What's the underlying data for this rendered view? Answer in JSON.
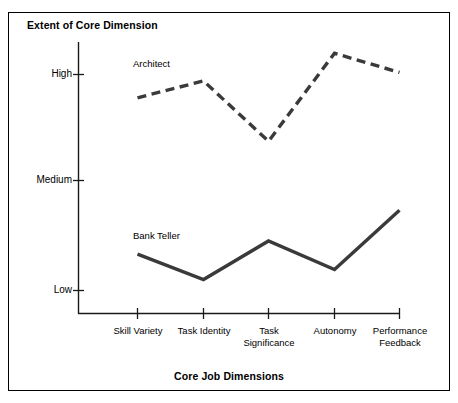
{
  "figure": {
    "title": "Extent of Core Dimension",
    "xaxis_title": "Core Job Dimensions"
  },
  "chart_data": {
    "type": "line",
    "title": "Extent of Core Dimension",
    "xlabel": "Core Job Dimensions",
    "ylabel": "Extent of Core Dimension",
    "categories": [
      "Skill Variety",
      "Task Identity",
      "Task Significance",
      "Autonomy",
      "Performance Feedback"
    ],
    "category_lines": [
      [
        "Skill Variety"
      ],
      [
        "Task Identity"
      ],
      [
        "Task",
        "Significance"
      ],
      [
        "Autonomy"
      ],
      [
        "Performance",
        "Feedback"
      ]
    ],
    "ytick_labels": [
      "High",
      "Medium",
      "Low"
    ],
    "ytick_values": [
      3,
      2,
      1
    ],
    "ylim": [
      0.6,
      3.35
    ],
    "grid": false,
    "legend": "inline-labels",
    "series": [
      {
        "name": "Architect",
        "style": "dashed",
        "color": "#3a3a3a",
        "values": [
          2.78,
          2.94,
          2.37,
          3.2,
          3.02
        ],
        "label_position": {
          "x": 133,
          "y": 58
        }
      },
      {
        "name": "Bank Teller",
        "style": "solid",
        "color": "#3a3a3a",
        "values": [
          1.33,
          1.1,
          1.45,
          1.19,
          1.73
        ],
        "label_position": {
          "x": 133,
          "y": 230
        }
      }
    ]
  }
}
